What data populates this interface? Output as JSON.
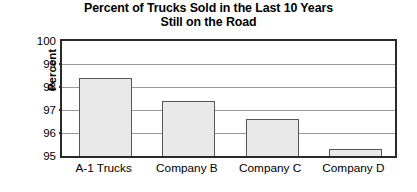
{
  "chart_data": {
    "type": "bar",
    "title": "Percent of Trucks Sold in the Last 10 Years Still on the Road",
    "title_lines": [
      "Percent of Trucks Sold in the Last 10 Years",
      "Still on the Road"
    ],
    "xlabel": "",
    "ylabel": "Percent",
    "categories": [
      "A-1 Trucks",
      "Company B",
      "Company C",
      "Company D"
    ],
    "values": [
      98.4,
      97.4,
      96.6,
      95.3
    ],
    "ylim": [
      95,
      100
    ],
    "ytick_labels": [
      "100",
      "99",
      "98",
      "97",
      "96",
      "95"
    ],
    "ytick_values": [
      100,
      99,
      98,
      97,
      96,
      95
    ],
    "grid": "horizontal",
    "legend": "none",
    "bar_fill_color": "#e9e9e9",
    "bar_edge_color": "#555555",
    "axis_color": "#2a2a2a",
    "gridline_color": "#9a9a9a",
    "background_color": "#ffffff"
  }
}
